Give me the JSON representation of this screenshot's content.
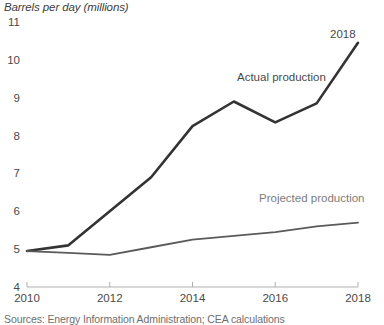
{
  "chart_data": {
    "type": "line",
    "title": "Barrels per day (millions)",
    "xlabel": "",
    "ylabel": "Barrels per day (millions)",
    "xlim": [
      2010,
      2018
    ],
    "ylim": [
      4,
      11
    ],
    "yticks": [
      4,
      5,
      6,
      7,
      8,
      9,
      10,
      11
    ],
    "ytick_labels": [
      "4",
      "5",
      "6",
      "7",
      "8",
      "9",
      "10",
      "11"
    ],
    "xticks": [
      2010,
      2012,
      2014,
      2016,
      2018
    ],
    "xtick_labels": [
      "2010",
      "2012",
      "2014",
      "2016",
      "2018"
    ],
    "grid": false,
    "legend": "annotations",
    "x": [
      2010,
      2011,
      2012,
      2013,
      2014,
      2015,
      2016,
      2017,
      2018
    ],
    "series": [
      {
        "name": "Actual production",
        "color": "#333333",
        "values": [
          4.95,
          5.1,
          6.0,
          6.9,
          8.25,
          8.9,
          8.35,
          8.85,
          10.45
        ]
      },
      {
        "name": "Projected production",
        "color": "#5a5a5a",
        "values": [
          4.95,
          4.9,
          4.85,
          5.05,
          5.25,
          5.35,
          5.45,
          5.6,
          5.7
        ]
      }
    ],
    "annotations": [
      {
        "text": "Actual production",
        "x": 2015.0,
        "y": 9.55
      },
      {
        "text": "Projected production",
        "x": 2016.1,
        "y": 6.35
      },
      {
        "text": "2018",
        "x": 2017.5,
        "y": 10.7
      }
    ],
    "source": "Sources: Energy Information Administration; CEA calculations"
  },
  "axis": {
    "line_color": "#b0b0b0"
  }
}
